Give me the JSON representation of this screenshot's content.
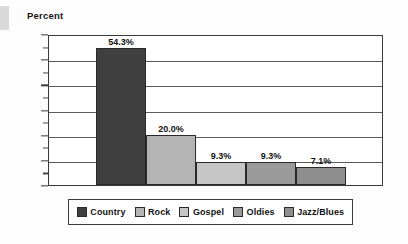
{
  "chart_data": {
    "type": "bar",
    "title": "",
    "subtitle": "",
    "xlabel": "",
    "ylabel": "Percent",
    "categories": [
      "Country",
      "Rock",
      "Gospel",
      "Oldies",
      "Jazz/Blues"
    ],
    "values": [
      54.3,
      20.0,
      9.3,
      9.3,
      7.1
    ],
    "data_labels": [
      "54.3%",
      "20.0%",
      "9.3%",
      "9.3%",
      "7.1%"
    ],
    "ylim": [
      0,
      60
    ],
    "ytick_values": [
      0,
      10,
      20,
      30,
      40,
      50,
      60
    ],
    "ytick_labels": [
      "0%",
      "10%",
      "20%",
      "30%",
      "40%",
      "50%",
      "60%"
    ],
    "yminor_tick_values": [
      5,
      15,
      25,
      35,
      45,
      55
    ],
    "grid": "horizontal",
    "legend_position": "bottom",
    "legend_entries": [
      {
        "label": "Country",
        "color": "#403f3f"
      },
      {
        "label": "Rock",
        "color": "#b4b4b4"
      },
      {
        "label": "Gospel",
        "color": "#c6c6c6"
      },
      {
        "label": "Oldies",
        "color": "#9a9a9a"
      },
      {
        "label": "Jazz/Blues",
        "color": "#8e8e8e"
      }
    ],
    "series_colors": [
      "#403f3f",
      "#b4b4b4",
      "#c6c6c6",
      "#9a9a9a",
      "#8e8e8e"
    ],
    "bar_gap": 0,
    "annotations": []
  }
}
